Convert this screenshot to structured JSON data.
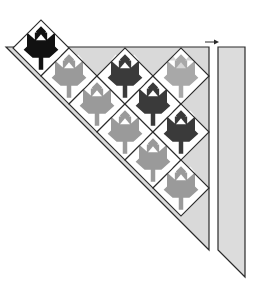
{
  "diagram": {
    "colors": {
      "background": "#ffffff",
      "outline": "#2a2a2a",
      "setting_triangle_fill": "#d9d9d9",
      "strip_fill": "#dcdcdc",
      "block_background": "#ffffff",
      "leaf_black": "#111111",
      "leaf_dark": "#3a3a3a",
      "leaf_gray": "#9a9a9a",
      "leaf_light_gray": "#a8a8a8",
      "block_corner_light": "#d6d6d6"
    },
    "lattice": {
      "origin_x": 181,
      "origin_y": 76,
      "step": 28,
      "half_diagonal": 28
    },
    "setting_triangle": {
      "top_left_x": 72,
      "top_y": 47,
      "right_x": 209,
      "bottom_y": 250
    },
    "border_strip": {
      "left_x": 218,
      "right_x": 245,
      "top_y": 47,
      "bottom_left_y": 250,
      "bottom_right_y": 277
    },
    "arrow": {
      "x1": 205,
      "x2": 219,
      "y": 42,
      "direction": "right"
    },
    "blocks": [
      {
        "k": 5,
        "m": -1,
        "leaf": "black"
      },
      {
        "k": 4,
        "m": 0,
        "leaf": "gray"
      },
      {
        "k": 3,
        "m": 1,
        "leaf": "gray"
      },
      {
        "k": 2,
        "m": 2,
        "leaf": "gray"
      },
      {
        "k": 1,
        "m": 3,
        "leaf": "gray"
      },
      {
        "k": 0,
        "m": 4,
        "leaf": "gray"
      },
      {
        "k": 2,
        "m": 0,
        "leaf": "dark"
      },
      {
        "k": 1,
        "m": 1,
        "leaf": "dark"
      },
      {
        "k": 0,
        "m": 2,
        "leaf": "dark"
      },
      {
        "k": 0,
        "m": 0,
        "leaf": "light_gray"
      }
    ]
  }
}
